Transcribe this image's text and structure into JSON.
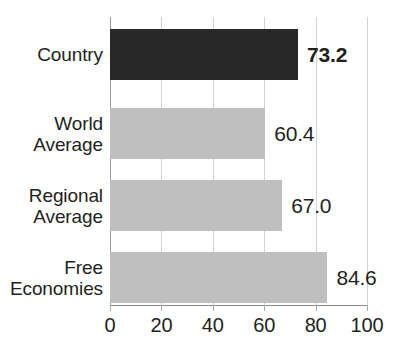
{
  "chart_data": {
    "type": "bar",
    "orientation": "horizontal",
    "title": "",
    "xlabel": "",
    "ylabel": "",
    "xlim": [
      0,
      100
    ],
    "grid": true,
    "legend": "none",
    "categories": [
      "Country",
      "World Average",
      "Regional Average",
      "Free Economies"
    ],
    "values": [
      73.2,
      60.4,
      67.0,
      84.6
    ],
    "value_labels": [
      "73.2",
      "60.4",
      "67.0",
      "84.6"
    ],
    "xticks": [
      0,
      20,
      40,
      60,
      80,
      100
    ],
    "xtick_labels": [
      "0",
      "20",
      "40",
      "60",
      "80",
      "100"
    ],
    "series": [
      {
        "name": "Score",
        "values": [
          73.2,
          60.4,
          67.0,
          84.6
        ]
      }
    ],
    "bars": [
      {
        "label_lines": [
          "Country"
        ],
        "category": "Country",
        "value": 73.2,
        "value_label": "73.2",
        "emphasis": true,
        "color": "#282828"
      },
      {
        "label_lines": [
          "World",
          "Average"
        ],
        "category": "World Average",
        "value": 60.4,
        "value_label": "60.4",
        "emphasis": false,
        "color": "#bfbfbf"
      },
      {
        "label_lines": [
          "Regional",
          "Average"
        ],
        "category": "Regional Average",
        "value": 67.0,
        "value_label": "67.0",
        "emphasis": false,
        "color": "#bfbfbf"
      },
      {
        "label_lines": [
          "Free",
          "Economies"
        ],
        "category": "Free Economies",
        "value": 84.6,
        "value_label": "84.6",
        "emphasis": false,
        "color": "#bfbfbf"
      }
    ],
    "colors": {
      "highlight_bar": "#282828",
      "default_bar": "#bfbfbf",
      "gridline": "#d2d2d2",
      "axis": "#8c8c8c",
      "text": "#231f20",
      "background": "#ffffff"
    }
  }
}
